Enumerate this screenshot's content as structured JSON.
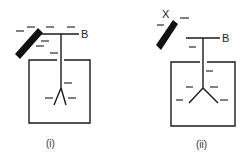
{
  "diagrams": [
    {
      "id": "i",
      "caption": "(i)",
      "rod_label": "",
      "terminal_label": "B",
      "description": "Negatively charged rod near electroscope cap B; leaves diverge slightly"
    },
    {
      "id": "ii",
      "caption": "(ii)",
      "rod_label": "X",
      "terminal_label": "B",
      "description": "Rod X moved away; electroscope remains negatively charged with wider divergence of leaves"
    }
  ],
  "charge_symbol": "−",
  "colors": {
    "ink": "#1a1a1a",
    "background": "#ffffff"
  }
}
